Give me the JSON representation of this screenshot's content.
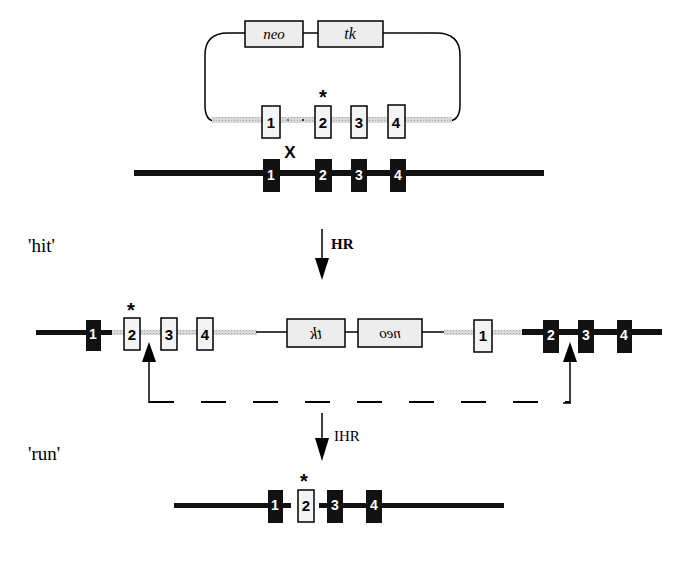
{
  "diagram": {
    "type": "hit-and-run gene targeting",
    "vector": {
      "genes": [
        {
          "label": "neo"
        },
        {
          "label": "tk"
        }
      ],
      "exons": [
        "1",
        "2",
        "3",
        "4"
      ],
      "mutation_marker": "*",
      "crossover_marker": "X"
    },
    "genomic_locus": {
      "exons": [
        "1",
        "2",
        "3",
        "4"
      ]
    },
    "steps": [
      {
        "label": "'hit'",
        "arrow_label": "HR"
      },
      {
        "label": "'run'",
        "arrow_label": "IHR"
      }
    ],
    "integrated_locus": {
      "left_exons": [
        "1",
        "2",
        "3",
        "4"
      ],
      "genes_reversed": [
        {
          "label": "tk"
        },
        {
          "label": "neo"
        }
      ],
      "vector_exon": "1",
      "right_exons": [
        "2",
        "3",
        "4"
      ],
      "mutation_marker": "*"
    },
    "final_locus": {
      "exons": [
        "1",
        "2",
        "3",
        "4"
      ],
      "mutation_marker": "*"
    },
    "colors": {
      "line": "#000000",
      "vector_backbone": "#c8c8c8",
      "box_fill": "#ededed",
      "exon_filled": "#111111",
      "exon_text_filled": "#ffffff"
    }
  }
}
